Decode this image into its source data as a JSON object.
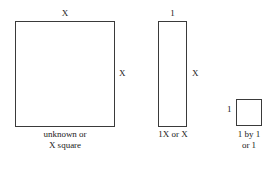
{
  "figure": {
    "type": "algebra-tiles-diagram",
    "title": "",
    "background_color": "#ffffff",
    "stroke_color": "#3a3a3a",
    "text_color": "#1a1a1a"
  },
  "tiles": [
    {
      "id": "x-square",
      "shape": "square",
      "top_label": "X",
      "right_label": "X",
      "caption_line1": "unknown or",
      "caption_line2": "X square"
    },
    {
      "id": "x-strip",
      "shape": "rectangle",
      "top_label": "1",
      "right_label": "X",
      "caption_line1": "1X or X",
      "caption_line2": ""
    },
    {
      "id": "unit-square",
      "shape": "square",
      "left_label": "1",
      "caption_line1": "1 by 1",
      "caption_line2": "or 1"
    }
  ]
}
